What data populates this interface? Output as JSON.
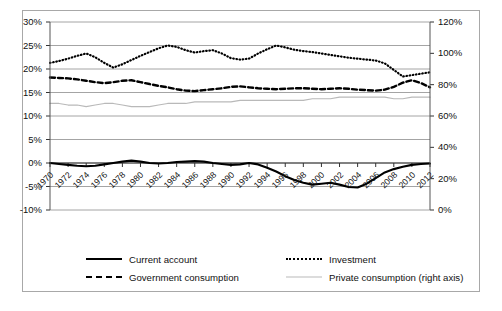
{
  "figure": {
    "caption": ""
  },
  "chart_data": {
    "type": "line",
    "title": "",
    "xlabel": "",
    "ylabel": "",
    "y2label": "",
    "grid": true,
    "legend_position": "bottom",
    "ylim": [
      -10,
      30
    ],
    "y2lim": [
      0,
      120
    ],
    "ytick_labels": [
      "30%",
      "25%",
      "20%",
      "15%",
      "10%",
      "5%",
      "0%",
      "-5%",
      "-10%"
    ],
    "ytick_values": [
      30,
      25,
      20,
      15,
      10,
      5,
      0,
      -5,
      -10
    ],
    "y2tick_labels": [
      "120%",
      "100%",
      "80%",
      "60%",
      "40%",
      "20%",
      "0%"
    ],
    "y2tick_values": [
      120,
      100,
      80,
      60,
      40,
      20,
      0
    ],
    "xtick_labels": [
      "1970",
      "1972",
      "1974",
      "1976",
      "1978",
      "1980",
      "1982",
      "1984",
      "1986",
      "1988",
      "1990",
      "1992",
      "1994",
      "1996",
      "1998",
      "2000",
      "2002",
      "2004",
      "2006",
      "2008",
      "2010",
      "2012"
    ],
    "x": [
      1970,
      1971,
      1972,
      1973,
      1974,
      1975,
      1976,
      1977,
      1978,
      1979,
      1980,
      1981,
      1982,
      1983,
      1984,
      1985,
      1986,
      1987,
      1988,
      1989,
      1990,
      1991,
      1992,
      1993,
      1994,
      1995,
      1996,
      1997,
      1998,
      1999,
      2000,
      2001,
      2002,
      2003,
      2004,
      2005,
      2006,
      2007,
      2008,
      2009,
      2010,
      2011,
      2012
    ],
    "series": [
      {
        "name": "Current account",
        "axis": "left",
        "style": "solid",
        "color": "#000000",
        "values": [
          0.0,
          -0.2,
          -0.4,
          -0.6,
          -0.7,
          -0.6,
          -0.3,
          0.0,
          0.3,
          0.5,
          0.3,
          0.0,
          -0.1,
          0.0,
          0.2,
          0.3,
          0.4,
          0.3,
          0.0,
          -0.2,
          -0.4,
          -0.3,
          0.0,
          -0.3,
          -1.0,
          -1.8,
          -2.8,
          -3.6,
          -4.2,
          -4.6,
          -4.4,
          -4.2,
          -4.6,
          -5.1,
          -5.2,
          -4.4,
          -3.2,
          -2.0,
          -1.3,
          -0.8,
          -0.4,
          -0.2,
          -0.1
        ]
      },
      {
        "name": "Investment",
        "axis": "left",
        "style": "dotted",
        "color": "#000000",
        "values": [
          21.3,
          21.7,
          22.2,
          22.8,
          23.3,
          22.5,
          21.3,
          20.3,
          21.0,
          21.9,
          22.8,
          23.6,
          24.4,
          25.0,
          24.7,
          24.0,
          23.5,
          23.8,
          24.0,
          23.3,
          22.3,
          22.0,
          22.2,
          23.3,
          24.2,
          25.0,
          24.6,
          24.1,
          23.8,
          23.6,
          23.3,
          23.0,
          22.7,
          22.4,
          22.2,
          22.0,
          21.8,
          21.2,
          19.8,
          18.4,
          18.7,
          19.0,
          19.3
        ]
      },
      {
        "name": "Government consumption",
        "axis": "left",
        "style": "dashed",
        "color": "#000000",
        "values": [
          18.2,
          18.1,
          18.0,
          17.8,
          17.5,
          17.2,
          17.0,
          17.2,
          17.5,
          17.6,
          17.2,
          16.8,
          16.4,
          16.1,
          15.7,
          15.4,
          15.3,
          15.5,
          15.7,
          15.9,
          16.2,
          16.3,
          16.1,
          15.9,
          15.8,
          15.7,
          15.8,
          15.9,
          15.9,
          15.8,
          15.7,
          15.8,
          15.9,
          15.8,
          15.6,
          15.5,
          15.4,
          15.6,
          16.2,
          17.1,
          17.6,
          17.0,
          16.1
        ]
      },
      {
        "name": "Private consumption (right axis)",
        "axis": "right",
        "style": "solid-gray",
        "color": "#b9b9b9",
        "values": [
          68,
          68,
          67,
          67,
          66,
          67,
          68,
          68,
          67,
          66,
          66,
          66,
          67,
          68,
          68,
          68,
          69,
          69,
          69,
          69,
          69,
          70,
          70,
          70,
          70,
          70,
          70,
          70,
          70,
          71,
          71,
          71,
          72,
          72,
          72,
          72,
          72,
          72,
          71,
          71,
          72,
          72,
          72
        ]
      }
    ]
  },
  "legend": {
    "entries": [
      {
        "label": "Current account",
        "style": "solid"
      },
      {
        "label": "Investment",
        "style": "dotted"
      },
      {
        "label": "Government consumption",
        "style": "dashed"
      },
      {
        "label": "Private consumption (right axis)",
        "style": "solid-gray"
      }
    ]
  }
}
